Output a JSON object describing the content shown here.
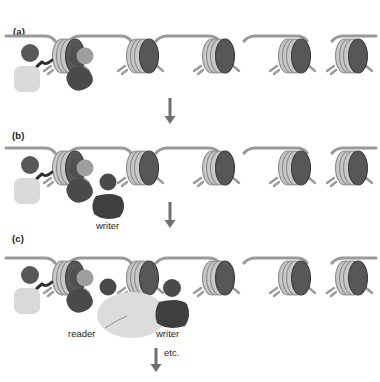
{
  "figure": {
    "background": "#ffffff",
    "width": 380,
    "height": 382
  },
  "colors": {
    "dna_linker": "#9a9a9a",
    "dna_coil_light": "#c9c9c9",
    "dna_coil_edge": "#8d8d8d",
    "histone_core": "#4f4f4f",
    "mark_dark": "#4a4a4a",
    "mark_mid": "#8f8f8f",
    "reader_fill": "#dcdcdc",
    "writer_fill": "#3f3f3f",
    "pale_block": "#d9d9d9",
    "arrow": "#6f6f6f",
    "text": "#1b1b1b"
  },
  "panels": [
    {
      "id": "a",
      "label": "(a)",
      "nucleosome_count": 5,
      "marks": [
        "existing-mark-dark",
        "existing-mark-pale",
        "existing-mark-mid",
        "existing-blob-dark"
      ],
      "annotations": []
    },
    {
      "id": "b",
      "label": "(b)",
      "nucleosome_count": 5,
      "marks": [
        "existing-mark-dark",
        "existing-mark-pale",
        "existing-mark-mid",
        "existing-blob-dark",
        "new-mark-dark"
      ],
      "annotations": [
        {
          "name": "writer",
          "text": "writer"
        }
      ]
    },
    {
      "id": "c",
      "label": "(c)",
      "nucleosome_count": 5,
      "marks": [
        "existing-mark-dark",
        "existing-mark-pale",
        "existing-mark-mid",
        "existing-blob-dark",
        "new-mark-dark",
        "next-mark-dark"
      ],
      "annotations": [
        {
          "name": "reader",
          "text": "reader"
        },
        {
          "name": "writer",
          "text": "writer"
        }
      ]
    }
  ],
  "arrows": [
    {
      "name": "arrow-a-to-b",
      "label": ""
    },
    {
      "name": "arrow-b-to-c",
      "label": ""
    },
    {
      "name": "arrow-c-onward",
      "label": "etc."
    }
  ],
  "labels": {
    "reader": "reader",
    "writer": "writer",
    "etc": "etc."
  }
}
